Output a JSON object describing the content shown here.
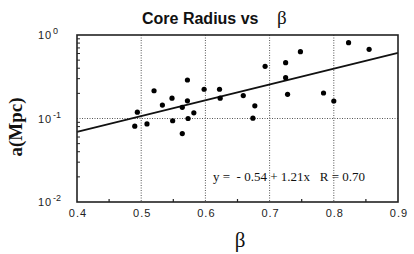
{
  "chart_data": {
    "type": "scatter",
    "title": "Core Radius vs",
    "title_symbol": "β",
    "xlabel": "β",
    "ylabel": "a(Mpc)",
    "xlim": [
      0.4,
      0.9
    ],
    "ylim": [
      0.01,
      1
    ],
    "yscale": "log",
    "x_ticks": [
      "0.4",
      "0.5",
      "0.6",
      "0.7",
      "0.8",
      "0.9"
    ],
    "y_ticks": [
      {
        "base": "10",
        "exp": "0"
      },
      {
        "base": "10",
        "exp": "-1"
      },
      {
        "base": "10",
        "exp": "-2"
      }
    ],
    "grid": {
      "x": [
        0.5,
        0.6,
        0.7,
        0.8
      ],
      "y": [
        0.1
      ],
      "style": "dotted"
    },
    "fit_annotation": "y =  - 0.54 + 1.21x   R = 0.70",
    "fit_line": {
      "x": [
        0.4,
        0.9
      ],
      "y": [
        0.069,
        0.612
      ]
    },
    "points": [
      {
        "x": 0.49,
        "y": 0.081
      },
      {
        "x": 0.494,
        "y": 0.119
      },
      {
        "x": 0.509,
        "y": 0.086
      },
      {
        "x": 0.52,
        "y": 0.215
      },
      {
        "x": 0.533,
        "y": 0.145
      },
      {
        "x": 0.548,
        "y": 0.175
      },
      {
        "x": 0.549,
        "y": 0.094
      },
      {
        "x": 0.564,
        "y": 0.136
      },
      {
        "x": 0.564,
        "y": 0.066
      },
      {
        "x": 0.572,
        "y": 0.289
      },
      {
        "x": 0.572,
        "y": 0.163
      },
      {
        "x": 0.573,
        "y": 0.1
      },
      {
        "x": 0.582,
        "y": 0.117
      },
      {
        "x": 0.598,
        "y": 0.224
      },
      {
        "x": 0.622,
        "y": 0.224
      },
      {
        "x": 0.623,
        "y": 0.175
      },
      {
        "x": 0.659,
        "y": 0.188
      },
      {
        "x": 0.677,
        "y": 0.142
      },
      {
        "x": 0.674,
        "y": 0.101
      },
      {
        "x": 0.693,
        "y": 0.422
      },
      {
        "x": 0.725,
        "y": 0.466
      },
      {
        "x": 0.725,
        "y": 0.308
      },
      {
        "x": 0.728,
        "y": 0.195
      },
      {
        "x": 0.748,
        "y": 0.631
      },
      {
        "x": 0.784,
        "y": 0.202
      },
      {
        "x": 0.8,
        "y": 0.162
      },
      {
        "x": 0.823,
        "y": 0.809
      },
      {
        "x": 0.855,
        "y": 0.674
      }
    ]
  }
}
